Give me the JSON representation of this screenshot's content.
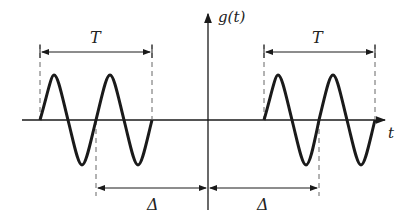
{
  "diagram": {
    "y_axis_label": "g(t)",
    "x_axis_label": "t",
    "period_label_left": "T",
    "period_label_right": "T",
    "shift_label_left": "Δ",
    "shift_label_right": "Δ",
    "colors": {
      "stroke": "#1a1a1a",
      "dashed": "#666666"
    }
  }
}
